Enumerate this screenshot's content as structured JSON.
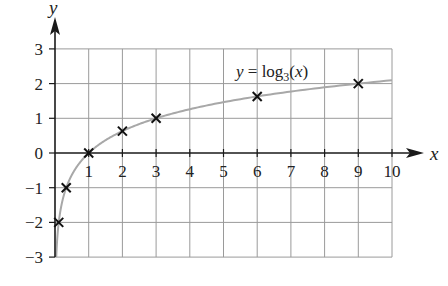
{
  "chart_data": {
    "type": "line",
    "title": "",
    "xlabel": "x",
    "ylabel": "y",
    "xlim": [
      0,
      10
    ],
    "ylim": [
      -3,
      3
    ],
    "grid": true,
    "x_ticks": [
      1,
      2,
      3,
      4,
      5,
      6,
      7,
      8,
      9,
      10
    ],
    "y_ticks": [
      3,
      2,
      1,
      0,
      -1,
      -2,
      -3
    ],
    "y_tick_labels": [
      "3",
      "2",
      "1",
      "0",
      "−1",
      "−2",
      "−3"
    ],
    "series": [
      {
        "name": "y = log3(x)",
        "function": "log3",
        "style": "curve",
        "color": "#a8a8a8",
        "x_range": [
          0.037,
          10
        ]
      },
      {
        "name": "marked points",
        "style": "cross-markers",
        "color": "#111111",
        "x": [
          0.111,
          0.333,
          1,
          2,
          3,
          6,
          9
        ],
        "y": [
          -2,
          -1,
          0,
          0.63,
          1,
          1.63,
          2
        ]
      }
    ],
    "annotations": [
      {
        "text": "y = log₃(x)",
        "x": 6.9,
        "y": 2.3
      }
    ]
  },
  "labels": {
    "x_axis": "x",
    "y_axis": "y",
    "equation_prefix": "y = log",
    "equation_subscript": "3",
    "equation_suffix": "(x)"
  },
  "colors": {
    "grid": "#9a9a9a",
    "axis": "#1a1a1a",
    "curve": "#a8a8a8",
    "marker": "#111111"
  }
}
